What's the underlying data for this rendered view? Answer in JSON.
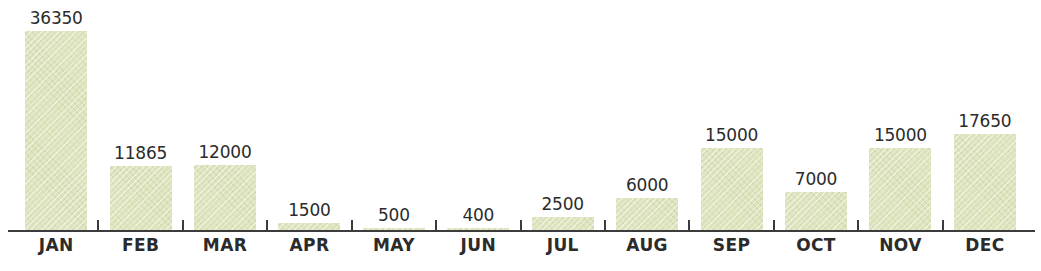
{
  "chart_data": {
    "type": "bar",
    "title": "",
    "subtitle": "",
    "xlabel": "",
    "ylabel": "",
    "categories": [
      "JAN",
      "FEB",
      "MAR",
      "APR",
      "MAY",
      "JUN",
      "JUL",
      "AUG",
      "SEP",
      "OCT",
      "NOV",
      "DEC"
    ],
    "values": [
      36350,
      11865,
      12000,
      1500,
      500,
      400,
      2500,
      6000,
      15000,
      7000,
      15000,
      17650
    ],
    "value_labels": [
      "36350",
      "11865",
      "12000",
      "1500",
      "500",
      "400",
      "2500",
      "6000",
      "15000",
      "7000",
      "15000",
      "17650"
    ],
    "ylim": [
      0,
      36350
    ],
    "grid": false,
    "legend": false,
    "legend_position": "none",
    "axis": {
      "baseline_visible": true,
      "tick_count": 11,
      "tick_labels_visible": false
    },
    "colors": {
      "bar_fill": "#dde3bd",
      "axis": "#3c3c3c",
      "label_text": "#2b2b2b",
      "value_text": "#2b2b2b",
      "background": "#ffffff"
    }
  }
}
